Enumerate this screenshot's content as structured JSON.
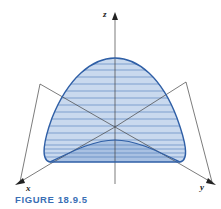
{
  "figure": {
    "caption": "FIGURE 18.9.5",
    "axes": {
      "x_label": "x",
      "y_label": "y",
      "z_label": "z"
    },
    "colors": {
      "surface_fill": "#c9d9ee",
      "surface_fill_dark": "#a9c1e2",
      "outline": "#2f5fa6",
      "hatch": "#4b78b8",
      "axis": "#444444",
      "caption": "#3a6fb5"
    }
  }
}
